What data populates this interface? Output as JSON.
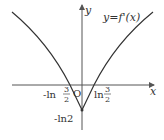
{
  "diagram": {
    "function_label": "y=f'(x)",
    "axis_x_label": "x",
    "axis_y_label": "y",
    "origin_label": "O",
    "x_intercepts": [
      {
        "prefix": "-ln",
        "num": "3",
        "den": "2"
      },
      {
        "prefix": "ln",
        "num": "3",
        "den": "2"
      }
    ],
    "y_min_label": "-ln2",
    "colors": {
      "curve": "#333333",
      "axis": "#555555"
    }
  }
}
